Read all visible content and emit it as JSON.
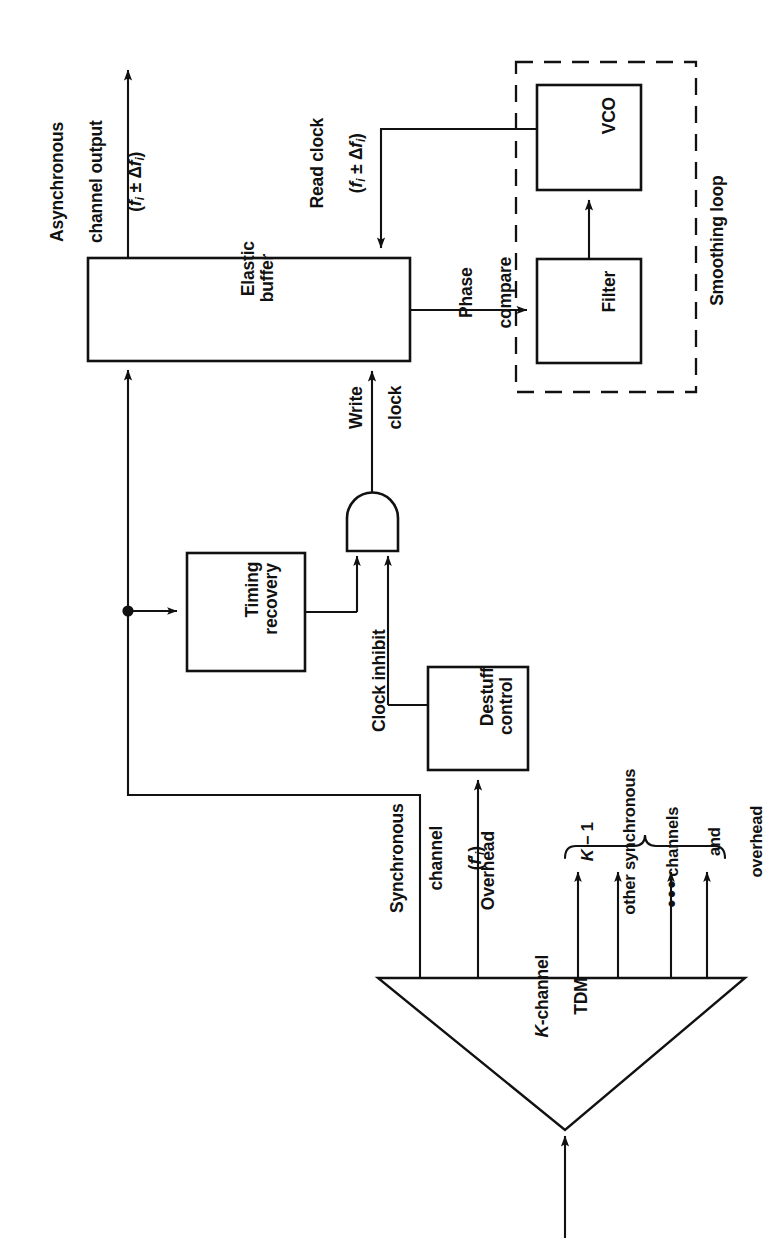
{
  "diagram": {
    "orientation": "rotated-90-ccw",
    "blocks": {
      "elastic_buffer": "Elastic\nbuffer",
      "timing_recovery": "Timing\nrecovery",
      "destuff_control": "Destuff\ncontrol",
      "vco": "VCO",
      "filter": "Filter",
      "tdm": "K-channel\nTDM",
      "and_gate": "AND gate",
      "smoothing_loop": "Smoothing loop"
    },
    "signals": {
      "async_out_line1": "Asynchronous",
      "async_out_line2": "channel output",
      "async_out_freq_pre": "(",
      "async_out_freq": "f",
      "async_out_sub": "i",
      "async_out_pm": " ± Δ",
      "async_out_f2": "f",
      "async_out_sub2": "i",
      "async_out_close": ")",
      "read_clock": "Read clock",
      "write_clock_line1": "Write",
      "write_clock_line2": "clock",
      "clock_inhibit": "Clock inhibit",
      "phase_compare_line1": "Phase",
      "phase_compare_line2": "compare",
      "sync_channel_line1": "Synchronous",
      "sync_channel_line2": "channel",
      "sync_channel_freq": "f",
      "sync_channel_sub": "i",
      "overhead": "Overhead"
    },
    "brace_label": {
      "line1_pre": "K",
      "line1_post": " − 1",
      "line2": "other synchronous",
      "line3": "channels",
      "line4": "and",
      "line5": "overhead"
    },
    "ellipsis": "•••",
    "colors": {
      "stroke": "#111111",
      "background": "#ffffff",
      "text": "#111111"
    }
  }
}
